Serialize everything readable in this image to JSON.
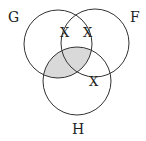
{
  "diagram": {
    "type": "venn",
    "sets": [
      {
        "id": "G",
        "label": "G"
      },
      {
        "id": "F",
        "label": "F"
      },
      {
        "id": "H",
        "label": "H"
      }
    ],
    "shaded_region": "G ∩ H",
    "marks": [
      {
        "symbol": "X",
        "region": "on F boundary inside G"
      },
      {
        "symbol": "X",
        "region": "on G boundary inside F"
      },
      {
        "symbol": "X",
        "region": "on F/H boundary outside G"
      }
    ],
    "colors": {
      "stroke": "#333333",
      "shade": "#d9d9d9",
      "background": "#ffffff"
    }
  }
}
